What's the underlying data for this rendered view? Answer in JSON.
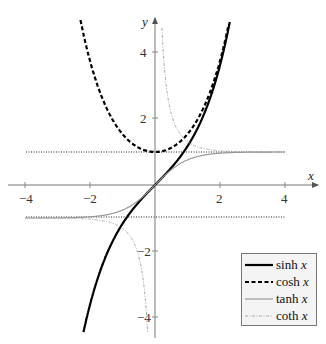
{
  "chart_data": {
    "type": "line",
    "title": "",
    "xlabel": "x",
    "ylabel": "y",
    "xlim": [
      -4.2,
      4.5
    ],
    "ylim": [
      -4.8,
      5.2
    ],
    "xticks": [
      -4,
      -2,
      2,
      4
    ],
    "yticks": [
      -4,
      -2,
      2,
      4
    ],
    "xtick_labels": [
      "−4",
      "−2",
      "2",
      "4"
    ],
    "ytick_labels": [
      "−4",
      "−2",
      "2",
      "4"
    ],
    "grid": false,
    "legend_position": "lower right",
    "asymptotes": [
      {
        "y": 1,
        "style": "dotted"
      },
      {
        "y": -1,
        "style": "dotted"
      }
    ],
    "series": [
      {
        "name": "sinh x",
        "func": "sinh",
        "style": "solid thick",
        "color": "#000000",
        "x": [
          -2.2,
          -2,
          -1.5,
          -1,
          -0.5,
          0,
          0.5,
          1,
          1.5,
          2,
          2.3
        ],
        "values": [
          -4.46,
          -3.63,
          -2.13,
          -1.18,
          -0.52,
          0,
          0.52,
          1.18,
          2.13,
          3.63,
          4.94
        ]
      },
      {
        "name": "cosh x",
        "func": "cosh",
        "style": "dashed thick",
        "color": "#000000",
        "x": [
          -2.3,
          -2,
          -1.5,
          -1,
          -0.5,
          0,
          0.5,
          1,
          1.5,
          2,
          2.25
        ],
        "values": [
          5.04,
          3.76,
          2.35,
          1.54,
          1.13,
          1,
          1.13,
          1.54,
          2.35,
          3.76,
          4.8
        ]
      },
      {
        "name": "tanh x",
        "func": "tanh",
        "style": "solid thin",
        "color": "#888888",
        "x": [
          -4,
          -3,
          -2,
          -1,
          -0.5,
          0,
          0.5,
          1,
          2,
          3,
          4
        ],
        "values": [
          -0.999,
          -0.995,
          -0.964,
          -0.762,
          -0.462,
          0,
          0.462,
          0.762,
          0.964,
          0.995,
          0.999
        ]
      },
      {
        "name": "coth x",
        "func": "coth",
        "style": "dash-dot thin",
        "color": "#999999",
        "x": [
          -4,
          -3,
          -2,
          -1,
          -0.5,
          -0.25,
          0.2,
          0.5,
          1,
          2,
          3,
          4
        ],
        "values": [
          -1.001,
          -1.005,
          -1.037,
          -1.313,
          -2.164,
          -4.083,
          5.07,
          2.164,
          1.313,
          1.037,
          1.005,
          1.001
        ]
      }
    ]
  },
  "legend": {
    "items": [
      {
        "func": "sinh",
        "var": "x"
      },
      {
        "func": "cosh",
        "var": "x"
      },
      {
        "func": "tanh",
        "var": "x"
      },
      {
        "func": "coth",
        "var": "x"
      }
    ]
  },
  "axes": {
    "x_label": "x",
    "y_label": "y",
    "x_ticks": [
      "−4",
      "−2",
      "2",
      "4"
    ],
    "y_ticks": [
      "4",
      "2",
      "−2",
      "−4"
    ]
  }
}
